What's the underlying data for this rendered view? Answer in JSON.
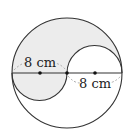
{
  "diagram": {
    "type": "geometry",
    "labels": {
      "left_radius": "8 cm",
      "right_radius": "8 cm"
    },
    "colors": {
      "shade": "#ececec",
      "stroke": "#333333",
      "dash": "#999999"
    }
  }
}
